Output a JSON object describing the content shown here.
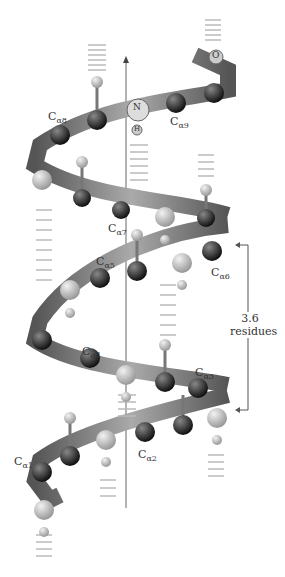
{
  "diagram": {
    "atom_labels": {
      "n": "N",
      "h": "H",
      "o": "O"
    },
    "calpha_labels": [
      {
        "prefix": "C",
        "sub": "α1"
      },
      {
        "prefix": "C",
        "sub": "α2"
      },
      {
        "prefix": "C",
        "sub": "α3"
      },
      {
        "prefix": "C",
        "sub": "α4"
      },
      {
        "prefix": "C",
        "sub": "α5"
      },
      {
        "prefix": "C",
        "sub": "α6"
      },
      {
        "prefix": "C",
        "sub": "α7"
      },
      {
        "prefix": "C",
        "sub": "α8"
      },
      {
        "prefix": "C",
        "sub": "α9"
      }
    ],
    "bracket": {
      "line1": "3.6",
      "line2": "residues"
    },
    "colors": {
      "ribbon_dark": "#4a4a4a",
      "ribbon_light": "#9a9a9a",
      "atom_dark": "#2a2a2a",
      "atom_light": "#c8c8c8"
    }
  }
}
